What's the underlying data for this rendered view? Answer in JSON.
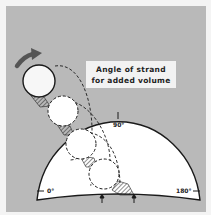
{
  "diagram": {
    "caption_line1": "Angle of strand",
    "caption_line2": "for added volume",
    "angle_labels": {
      "start": "0°",
      "middle": "90°",
      "end": "180°"
    },
    "elements": {
      "direction_arrow": "curved-arrow-icon",
      "strand_circles": 4,
      "base_arrows": 2
    },
    "colors": {
      "background": "#b9b9b9",
      "dial": "#ffffff",
      "stroke": "#1a1a1a",
      "arrow": "#555555"
    }
  }
}
